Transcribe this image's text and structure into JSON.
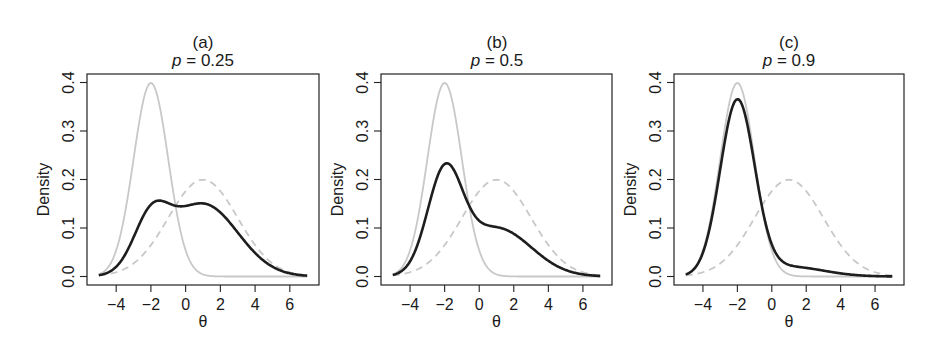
{
  "chart_data": [
    {
      "type": "line",
      "panel_label": "(a)",
      "title": "p = 0.25",
      "title_italic_part": "p",
      "title_value": "0.25",
      "p": 0.25,
      "xlabel": "θ",
      "ylabel": "Density",
      "xlim": [
        -5,
        7
      ],
      "ylim": [
        0,
        0.4
      ],
      "xticks": [
        -4,
        -2,
        0,
        2,
        4,
        6
      ],
      "yticks": [
        0.0,
        0.1,
        0.2,
        0.3,
        0.4
      ],
      "ytick_labels": [
        "0.0",
        "0.1",
        "0.2",
        "0.3",
        "0.4"
      ],
      "grid": false,
      "series": [
        {
          "name": "Component 1 N(-2,1)",
          "style": "solid-light-gray",
          "mean": -2,
          "sd": 1,
          "peak": 0.399
        },
        {
          "name": "Component 2 N(1,2)",
          "style": "dashed-light-gray",
          "mean": 1,
          "sd": 2,
          "peak": 0.199
        },
        {
          "name": "Mixture",
          "style": "solid-black-thick",
          "x": [
            -5,
            -4,
            -3,
            -2,
            -1.5,
            -1,
            0,
            1,
            2,
            3,
            4,
            5,
            6,
            7
          ],
          "y": [
            0.004,
            0.025,
            0.095,
            0.148,
            0.156,
            0.15,
            0.145,
            0.15,
            0.139,
            0.102,
            0.061,
            0.028,
            0.01,
            0.003
          ]
        }
      ]
    },
    {
      "type": "line",
      "panel_label": "(b)",
      "title": "p = 0.5",
      "title_italic_part": "p",
      "title_value": "0.5",
      "p": 0.5,
      "xlabel": "θ",
      "ylabel": "Density",
      "xlim": [
        -5,
        7
      ],
      "ylim": [
        0,
        0.4
      ],
      "xticks": [
        -4,
        -2,
        0,
        2,
        4,
        6
      ],
      "yticks": [
        0.0,
        0.1,
        0.2,
        0.3,
        0.4
      ],
      "ytick_labels": [
        "0.0",
        "0.1",
        "0.2",
        "0.3",
        "0.4"
      ],
      "grid": false,
      "series": [
        {
          "name": "Component 1 N(-2,1)",
          "style": "solid-light-gray",
          "mean": -2,
          "sd": 1,
          "peak": 0.399
        },
        {
          "name": "Component 2 N(1,2)",
          "style": "dashed-light-gray",
          "mean": 1,
          "sd": 2,
          "peak": 0.199
        },
        {
          "name": "Mixture",
          "style": "solid-black-thick",
          "x": [
            -5,
            -4,
            -3,
            -2,
            -1,
            0,
            1,
            2,
            3,
            4,
            5,
            6,
            7
          ],
          "y": [
            0.005,
            0.033,
            0.143,
            0.232,
            0.186,
            0.115,
            0.102,
            0.093,
            0.068,
            0.04,
            0.018,
            0.007,
            0.002
          ]
        }
      ]
    },
    {
      "type": "line",
      "panel_label": "(c)",
      "title": "p = 0.9",
      "title_italic_part": "p",
      "title_value": "0.9",
      "p": 0.9,
      "xlabel": "θ",
      "ylabel": "Density",
      "xlim": [
        -5,
        7
      ],
      "ylim": [
        0,
        0.4
      ],
      "xticks": [
        -4,
        -2,
        0,
        2,
        4,
        6
      ],
      "yticks": [
        0.0,
        0.1,
        0.2,
        0.3,
        0.4
      ],
      "ytick_labels": [
        "0.0",
        "0.1",
        "0.2",
        "0.3",
        "0.4"
      ],
      "grid": false,
      "series": [
        {
          "name": "Component 1 N(-2,1)",
          "style": "solid-light-gray",
          "mean": -2,
          "sd": 1,
          "peak": 0.399
        },
        {
          "name": "Component 2 N(1,2)",
          "style": "dashed-light-gray",
          "mean": 1,
          "sd": 2,
          "peak": 0.199
        },
        {
          "name": "Mixture",
          "style": "solid-black-thick",
          "x": [
            -5,
            -4,
            -3,
            -2,
            -1,
            0,
            1,
            2,
            3,
            4,
            5,
            6,
            7
          ],
          "y": [
            0.005,
            0.05,
            0.222,
            0.366,
            0.236,
            0.066,
            0.03,
            0.018,
            0.012,
            0.006,
            0.003,
            0.001,
            0.0
          ]
        }
      ]
    }
  ],
  "colors": {
    "mixture": "#1e1e1e",
    "component": "#c8c8c8",
    "axis": "#222222",
    "background": "#ffffff"
  }
}
